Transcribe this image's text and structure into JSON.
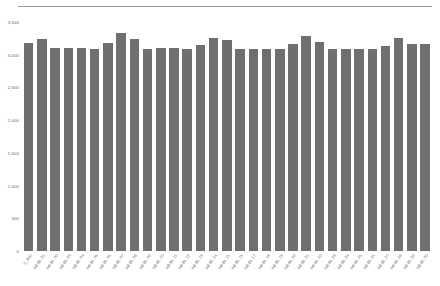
{
  "chart": {
    "title": "",
    "top_rule_color": "#9a9a9a",
    "bar_color": "#6f6f6f",
    "axis_text_color": "#5d5d5d"
  },
  "chart_data": {
    "type": "bar",
    "title": "",
    "xlabel": "",
    "ylabel": "",
    "ylim": [
      0,
      3500
    ],
    "grid": false,
    "legend": false,
    "ytick_labels": [
      "3,500",
      "3,000",
      "2,500",
      "2,000",
      "1,500",
      "1,000",
      "500",
      "0"
    ],
    "ytick_values": [
      3500,
      3000,
      2500,
      2000,
      1500,
      1000,
      500,
      0
    ],
    "categories": [
      "2_IND",
      "AB.BL.01",
      "AB.BL.02",
      "AB.BL.03",
      "AB.BL.04",
      "AB.BL.05",
      "AB.BL.06",
      "AB.BL.07",
      "AB.BL.08",
      "AB.BL.09",
      "AB.BL.10",
      "AB.BL.11",
      "AB.BL.12",
      "AB.BL.13",
      "AB.BL.14",
      "AB.BL.15",
      "AB.BL.16",
      "AB.BL.17",
      "AB.BL.18",
      "AB.BL.19",
      "AB.BL.20",
      "AB.BL.21",
      "AB.BL.22",
      "AB.BL.23",
      "AB.BL.24",
      "AB.BL.25",
      "AB.BL.26",
      "AB.BL.27",
      "AB.BL.28",
      "AB.BL.29",
      "AB.BL.30"
    ],
    "values": [
      3180,
      3240,
      3105,
      3105,
      3100,
      3090,
      3180,
      3330,
      3240,
      3090,
      3100,
      3100,
      3080,
      3150,
      3260,
      3220,
      3090,
      3090,
      3095,
      3090,
      3160,
      3280,
      3195,
      3080,
      3085,
      3090,
      3080,
      3140,
      3250,
      3170,
      3170
    ]
  }
}
